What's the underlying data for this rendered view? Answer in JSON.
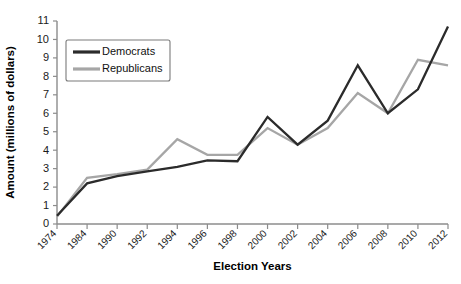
{
  "chart_data": {
    "type": "line",
    "title": "",
    "xlabel": "Election Years",
    "ylabel": "Amount (millions of dollars)",
    "categories": [
      "1974",
      "1984",
      "1990",
      "1992",
      "1994",
      "1996",
      "1998",
      "2000",
      "2002",
      "2004",
      "2006",
      "2008",
      "2010",
      "2012"
    ],
    "ylim": [
      0,
      11
    ],
    "yticks": [
      0,
      1,
      2,
      3,
      4,
      5,
      6,
      7,
      8,
      9,
      10,
      11
    ],
    "grid": false,
    "legend_position": "upper-left",
    "series": [
      {
        "name": "Democrats",
        "color": "#2b2b2b",
        "values": [
          0.45,
          2.2,
          2.6,
          2.85,
          3.1,
          3.45,
          3.4,
          5.8,
          4.3,
          5.6,
          8.6,
          6.0,
          7.3,
          10.7
        ]
      },
      {
        "name": "Republicans",
        "color": "#a6a6a6",
        "values": [
          0.4,
          2.5,
          2.7,
          2.95,
          4.6,
          3.75,
          3.75,
          5.2,
          4.3,
          5.2,
          7.1,
          6.0,
          8.9,
          8.6
        ]
      }
    ]
  },
  "legend": {
    "entries": [
      {
        "label": "Democrats"
      },
      {
        "label": "Republicans"
      }
    ]
  },
  "axes": {
    "y_title": "Amount (millions of dollars)",
    "x_title": "Election Years"
  }
}
